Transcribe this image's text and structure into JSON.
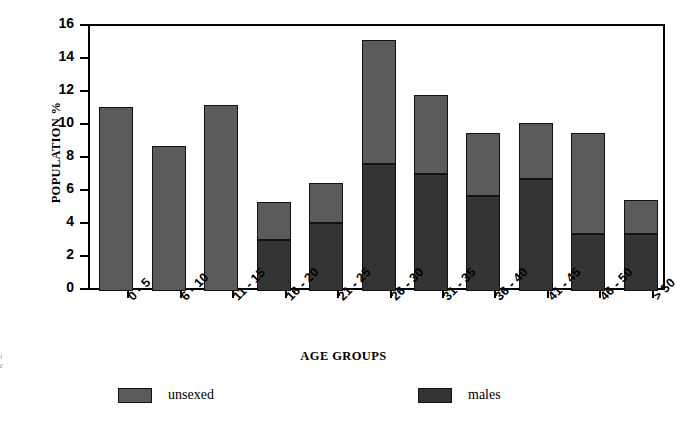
{
  "figure": {
    "margin_note_line1": "i",
    "margin_note_line2": "c"
  },
  "chart_data": {
    "type": "bar",
    "subtype": "stacked-bar",
    "title": "",
    "xlabel": "AGE GROUPS",
    "ylabel": "POPULATION %",
    "ylim": [
      0,
      16
    ],
    "yticks": [
      0,
      2,
      4,
      6,
      8,
      10,
      12,
      14,
      16
    ],
    "ytick_labels": [
      "0",
      "2",
      "4",
      "6",
      "8",
      "10",
      "12",
      "14",
      "16"
    ],
    "grid": false,
    "legend_position": "bottom",
    "categories": [
      "0 - 5",
      "6 - 10",
      "11 - 15",
      "16 - 20",
      "21 - 25",
      "26 - 30",
      "31 - 35",
      "36 - 40",
      "41 - 45",
      "46 - 50",
      "> 50"
    ],
    "series": [
      {
        "name": "males",
        "color": "#343434",
        "values": [
          0,
          0,
          0,
          3.1,
          4.1,
          7.7,
          7.1,
          5.75,
          6.8,
          3.45,
          3.45
        ]
      },
      {
        "name": "unsexed",
        "color": "#5b5b5b",
        "values": [
          11.15,
          8.8,
          11.3,
          0,
          0,
          0,
          0,
          0,
          0,
          0,
          0
        ]
      },
      {
        "name": "females",
        "color": "#5b5b5b",
        "values": [
          0,
          0,
          0,
          2.3,
          2.45,
          7.5,
          4.8,
          3.8,
          3.4,
          6.15,
          2.05
        ]
      }
    ],
    "totals": [
      11.15,
      8.8,
      11.3,
      5.4,
      6.55,
      15.2,
      11.9,
      9.55,
      10.2,
      9.6,
      5.5
    ],
    "legend": [
      {
        "label": "unsexed",
        "color": "#5b5b5b"
      },
      {
        "label": "males",
        "color": "#343434"
      },
      {
        "label": "females",
        "color": "#5b5b5b"
      }
    ]
  }
}
